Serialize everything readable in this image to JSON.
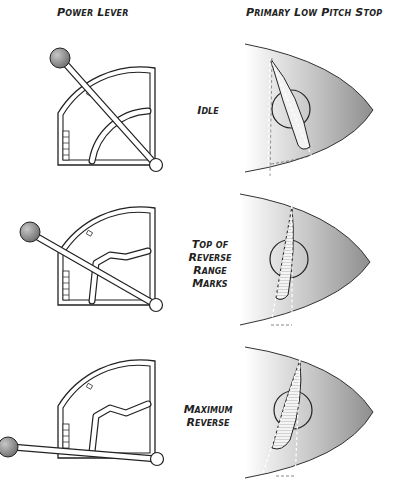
{
  "headers": {
    "left": "Power Lever",
    "right": "Primary Low Pitch Stop"
  },
  "rows": [
    {
      "id": "idle",
      "label_lines": [
        "Idle"
      ]
    },
    {
      "id": "top-of-reverse",
      "label_lines": [
        "Top of",
        "Reverse",
        "Range",
        "Marks"
      ]
    },
    {
      "id": "maximum-reverse",
      "label_lines": [
        "Maximum",
        "Reverse"
      ]
    }
  ],
  "colors": {
    "line": "#222222",
    "knob": "#8a8a8a",
    "spinner_dark": "#9a9a9a",
    "spinner_light": "#ffffff",
    "blade_fill": "#f2f2f2"
  }
}
